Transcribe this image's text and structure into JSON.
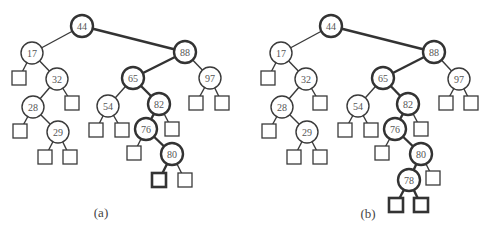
{
  "figure": {
    "width": 490,
    "height": 230,
    "colors": {
      "stroke": "#3a3a3a",
      "bold_stroke": "#333333",
      "label": "#555555",
      "background": "#ffffff"
    },
    "node_radius": 11,
    "leaf_size": 14
  },
  "trees": [
    {
      "id": "a",
      "caption": "(a)",
      "caption_pos": [
        101,
        212
      ],
      "nodes": [
        {
          "id": "n44",
          "label": "44",
          "x": 82,
          "y": 26,
          "bold": true
        },
        {
          "id": "n17",
          "label": "17",
          "x": 32,
          "y": 53,
          "bold": false
        },
        {
          "id": "n32",
          "label": "32",
          "x": 57,
          "y": 79,
          "bold": false
        },
        {
          "id": "n28",
          "label": "28",
          "x": 33,
          "y": 107,
          "bold": false
        },
        {
          "id": "n29",
          "label": "29",
          "x": 58,
          "y": 132,
          "bold": false
        },
        {
          "id": "n88",
          "label": "88",
          "x": 185,
          "y": 52,
          "bold": true
        },
        {
          "id": "n65",
          "label": "65",
          "x": 133,
          "y": 78,
          "bold": true
        },
        {
          "id": "n97",
          "label": "97",
          "x": 210,
          "y": 78,
          "bold": false
        },
        {
          "id": "n54",
          "label": "54",
          "x": 108,
          "y": 106,
          "bold": false
        },
        {
          "id": "n82",
          "label": "82",
          "x": 159,
          "y": 104,
          "bold": true
        },
        {
          "id": "n76",
          "label": "76",
          "x": 146,
          "y": 129,
          "bold": true
        },
        {
          "id": "n80",
          "label": "80",
          "x": 172,
          "y": 154,
          "bold": true
        }
      ],
      "leaves": [
        {
          "id": "l17L",
          "x": 19,
          "y": 78,
          "bold": false
        },
        {
          "id": "l28L",
          "x": 20,
          "y": 131,
          "bold": false
        },
        {
          "id": "l29L",
          "x": 45,
          "y": 157,
          "bold": false
        },
        {
          "id": "l29R",
          "x": 70,
          "y": 157,
          "bold": false
        },
        {
          "id": "l32R",
          "x": 72,
          "y": 103,
          "bold": false
        },
        {
          "id": "l54L",
          "x": 96,
          "y": 130,
          "bold": false
        },
        {
          "id": "l54R",
          "x": 122,
          "y": 130,
          "bold": false
        },
        {
          "id": "l82R",
          "x": 172,
          "y": 129,
          "bold": false
        },
        {
          "id": "l76L",
          "x": 134,
          "y": 153,
          "bold": false
        },
        {
          "id": "l80L",
          "x": 159,
          "y": 180,
          "bold": true
        },
        {
          "id": "l80R",
          "x": 185,
          "y": 180,
          "bold": false
        },
        {
          "id": "l97L",
          "x": 196,
          "y": 103,
          "bold": false
        },
        {
          "id": "l97R",
          "x": 222,
          "y": 103,
          "bold": false
        }
      ],
      "edges": [
        {
          "from": "n44",
          "to": "n17",
          "bold": false
        },
        {
          "from": "n44",
          "to": "n88",
          "bold": true
        },
        {
          "from": "n17",
          "to": "l17L",
          "bold": false
        },
        {
          "from": "n17",
          "to": "n32",
          "bold": false
        },
        {
          "from": "n32",
          "to": "n28",
          "bold": false
        },
        {
          "from": "n32",
          "to": "l32R",
          "bold": false
        },
        {
          "from": "n28",
          "to": "l28L",
          "bold": false
        },
        {
          "from": "n28",
          "to": "n29",
          "bold": false
        },
        {
          "from": "n29",
          "to": "l29L",
          "bold": false
        },
        {
          "from": "n29",
          "to": "l29R",
          "bold": false
        },
        {
          "from": "n88",
          "to": "n65",
          "bold": true
        },
        {
          "from": "n88",
          "to": "n97",
          "bold": false
        },
        {
          "from": "n65",
          "to": "n54",
          "bold": false
        },
        {
          "from": "n65",
          "to": "n82",
          "bold": true
        },
        {
          "from": "n54",
          "to": "l54L",
          "bold": false
        },
        {
          "from": "n54",
          "to": "l54R",
          "bold": false
        },
        {
          "from": "n82",
          "to": "n76",
          "bold": true
        },
        {
          "from": "n82",
          "to": "l82R",
          "bold": false
        },
        {
          "from": "n76",
          "to": "l76L",
          "bold": false
        },
        {
          "from": "n76",
          "to": "n80",
          "bold": true
        },
        {
          "from": "n80",
          "to": "l80L",
          "bold": true
        },
        {
          "from": "n80",
          "to": "l80R",
          "bold": false
        },
        {
          "from": "n97",
          "to": "l97L",
          "bold": false
        },
        {
          "from": "n97",
          "to": "l97R",
          "bold": false
        }
      ]
    },
    {
      "id": "b",
      "caption": "(b)",
      "caption_pos": [
        368,
        213
      ],
      "nodes": [
        {
          "id": "n44",
          "label": "44",
          "x": 331,
          "y": 26,
          "bold": true
        },
        {
          "id": "n17",
          "label": "17",
          "x": 281,
          "y": 53,
          "bold": false
        },
        {
          "id": "n32",
          "label": "32",
          "x": 306,
          "y": 79,
          "bold": false
        },
        {
          "id": "n28",
          "label": "28",
          "x": 282,
          "y": 107,
          "bold": false
        },
        {
          "id": "n29",
          "label": "29",
          "x": 307,
          "y": 132,
          "bold": false
        },
        {
          "id": "n88",
          "label": "88",
          "x": 434,
          "y": 52,
          "bold": true
        },
        {
          "id": "n65",
          "label": "65",
          "x": 383,
          "y": 78,
          "bold": true
        },
        {
          "id": "n97",
          "label": "97",
          "x": 459,
          "y": 79,
          "bold": false
        },
        {
          "id": "n54",
          "label": "54",
          "x": 358,
          "y": 106,
          "bold": false
        },
        {
          "id": "n82",
          "label": "82",
          "x": 408,
          "y": 104,
          "bold": true
        },
        {
          "id": "n76",
          "label": "76",
          "x": 395,
          "y": 129,
          "bold": true
        },
        {
          "id": "n80",
          "label": "80",
          "x": 421,
          "y": 154,
          "bold": true
        },
        {
          "id": "n78",
          "label": "78",
          "x": 409,
          "y": 180,
          "bold": true
        }
      ],
      "leaves": [
        {
          "id": "l17L",
          "x": 268,
          "y": 78,
          "bold": false
        },
        {
          "id": "l28L",
          "x": 269,
          "y": 131,
          "bold": false
        },
        {
          "id": "l29L",
          "x": 294,
          "y": 157,
          "bold": false
        },
        {
          "id": "l29R",
          "x": 320,
          "y": 157,
          "bold": false
        },
        {
          "id": "l32R",
          "x": 320,
          "y": 103,
          "bold": false
        },
        {
          "id": "l54L",
          "x": 345,
          "y": 130,
          "bold": false
        },
        {
          "id": "l54R",
          "x": 371,
          "y": 130,
          "bold": false
        },
        {
          "id": "l82R",
          "x": 421,
          "y": 129,
          "bold": false
        },
        {
          "id": "l76L",
          "x": 382,
          "y": 153,
          "bold": false
        },
        {
          "id": "l80R",
          "x": 433,
          "y": 178,
          "bold": false
        },
        {
          "id": "l78L",
          "x": 396,
          "y": 205,
          "bold": true
        },
        {
          "id": "l78R",
          "x": 421,
          "y": 205,
          "bold": true
        },
        {
          "id": "l97L",
          "x": 446,
          "y": 103,
          "bold": false
        },
        {
          "id": "l97R",
          "x": 471,
          "y": 103,
          "bold": false
        }
      ],
      "edges": [
        {
          "from": "n44",
          "to": "n17",
          "bold": false
        },
        {
          "from": "n44",
          "to": "n88",
          "bold": true
        },
        {
          "from": "n17",
          "to": "l17L",
          "bold": false
        },
        {
          "from": "n17",
          "to": "n32",
          "bold": false
        },
        {
          "from": "n32",
          "to": "n28",
          "bold": false
        },
        {
          "from": "n32",
          "to": "l32R",
          "bold": false
        },
        {
          "from": "n28",
          "to": "l28L",
          "bold": false
        },
        {
          "from": "n28",
          "to": "n29",
          "bold": false
        },
        {
          "from": "n29",
          "to": "l29L",
          "bold": false
        },
        {
          "from": "n29",
          "to": "l29R",
          "bold": false
        },
        {
          "from": "n88",
          "to": "n65",
          "bold": true
        },
        {
          "from": "n88",
          "to": "n97",
          "bold": false
        },
        {
          "from": "n65",
          "to": "n54",
          "bold": false
        },
        {
          "from": "n65",
          "to": "n82",
          "bold": true
        },
        {
          "from": "n54",
          "to": "l54L",
          "bold": false
        },
        {
          "from": "n54",
          "to": "l54R",
          "bold": false
        },
        {
          "from": "n82",
          "to": "n76",
          "bold": true
        },
        {
          "from": "n82",
          "to": "l82R",
          "bold": false
        },
        {
          "from": "n76",
          "to": "l76L",
          "bold": false
        },
        {
          "from": "n76",
          "to": "n80",
          "bold": true
        },
        {
          "from": "n80",
          "to": "n78",
          "bold": true
        },
        {
          "from": "n80",
          "to": "l80R",
          "bold": false
        },
        {
          "from": "n78",
          "to": "l78L",
          "bold": true
        },
        {
          "from": "n78",
          "to": "l78R",
          "bold": true
        },
        {
          "from": "n97",
          "to": "l97L",
          "bold": false
        },
        {
          "from": "n97",
          "to": "l97R",
          "bold": false
        }
      ]
    }
  ]
}
